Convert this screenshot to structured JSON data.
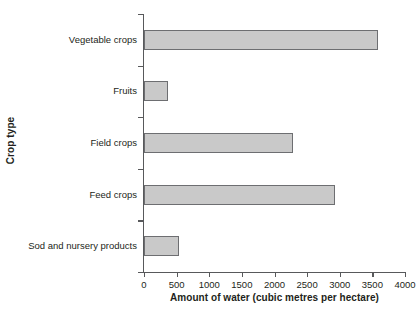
{
  "chart_data": {
    "type": "bar",
    "orientation": "horizontal",
    "title": "",
    "xlabel": "Amount of water (cubic metres per hectare)",
    "ylabel": "Crop type",
    "categories": [
      "Vegetable crops",
      "Fruits",
      "Field crops",
      "Feed crops",
      "Sod and nursery products"
    ],
    "values": [
      3580,
      370,
      2280,
      2930,
      540
    ],
    "xlim": [
      0,
      4000
    ],
    "xticks": [
      0,
      500,
      1000,
      1500,
      2000,
      2500,
      3000,
      3500,
      4000
    ],
    "xtick_labels": [
      "0",
      "500",
      "1000",
      "1500",
      "2000",
      "2500",
      "3000",
      "3500",
      "4000"
    ],
    "grid": false,
    "legend": null,
    "bar_fill_color": "#c9c9c9",
    "bar_edge_color": "#6d6e71",
    "axis_color": "#58595b",
    "background_color": "#ffffff"
  }
}
